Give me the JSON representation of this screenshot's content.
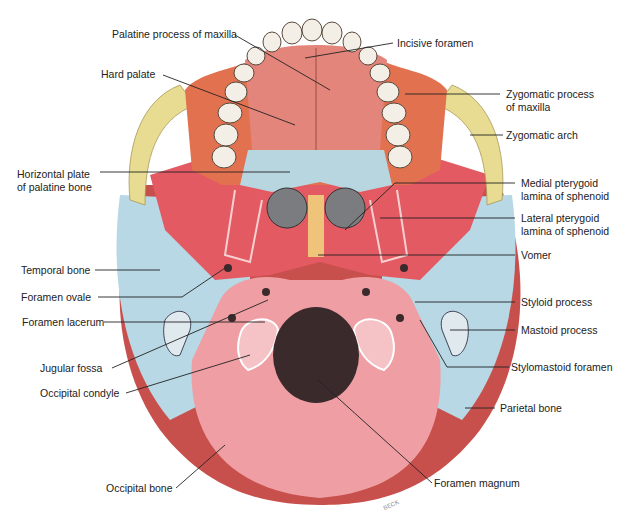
{
  "diagram": {
    "colors": {
      "maxilla": "#e2724f",
      "palatine_process": "#e3857a",
      "zygomatic": "#e8dc92",
      "sphenoid": "#e35a63",
      "palatine_bone": "#b8d6e0",
      "temporal": "#b7d8e4",
      "occipital": "#ef9ea4",
      "parietal": "#c8504c",
      "vomer": "#f0c37a",
      "teeth": "#f3efe6",
      "foramen": "#3a2a2c"
    },
    "labels_left": [
      {
        "id": "palatine-process-of-maxilla",
        "text": "Palatine process of maxilla"
      },
      {
        "id": "hard-palate",
        "text": "Hard palate"
      },
      {
        "id": "horizontal-plate-of-palatine-bone",
        "line1": "Horizontal plate",
        "line2": "of palatine bone"
      },
      {
        "id": "temporal-bone",
        "text": "Temporal bone"
      },
      {
        "id": "foramen-ovale",
        "text": "Foramen ovale"
      },
      {
        "id": "foramen-lacerum",
        "text": "Foramen lacerum"
      },
      {
        "id": "jugular-fossa",
        "text": "Jugular fossa"
      },
      {
        "id": "occipital-condyle",
        "text": "Occipital condyle"
      },
      {
        "id": "occipital-bone",
        "text": "Occipital bone"
      }
    ],
    "labels_right": [
      {
        "id": "incisive-foramen",
        "text": "Incisive foramen"
      },
      {
        "id": "zygomatic-process-of-maxilla",
        "line1": "Zygomatic process",
        "line2": "of maxilla"
      },
      {
        "id": "zygomatic-arch",
        "text": "Zygomatic arch"
      },
      {
        "id": "medial-pterygoid-lamina",
        "line1": "Medial pterygoid",
        "line2": "lamina of sphenoid"
      },
      {
        "id": "lateral-pterygoid-lamina",
        "line1": "Lateral pterygoid",
        "line2": "lamina of sphenoid"
      },
      {
        "id": "vomer",
        "text": "Vomer"
      },
      {
        "id": "styloid-process",
        "text": "Styloid process"
      },
      {
        "id": "mastoid-process",
        "text": "Mastoid process"
      },
      {
        "id": "stylomastoid-foramen",
        "text": "Stylomastoid foramen"
      },
      {
        "id": "parietal-bone",
        "text": "Parietal bone"
      },
      {
        "id": "foramen-magnum",
        "text": "Foramen magnum"
      }
    ],
    "signature": "BECK"
  }
}
